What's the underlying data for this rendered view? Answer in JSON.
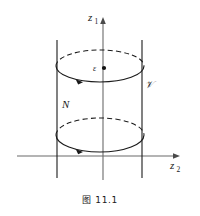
{
  "figure": {
    "caption": "图 11.1",
    "labels": {
      "vertical_axis": "z",
      "vertical_axis_subscript": "1",
      "horizontal_axis": "z",
      "horizontal_axis_subscript": "2",
      "center_point": "ε",
      "cylinder_left": "N",
      "cylinder_right": "𝒱"
    },
    "colors": {
      "stroke": "#1a1a1a",
      "axis": "#555555",
      "background": "#ffffff"
    },
    "geometry": {
      "vertical_axis_x": 103,
      "vertical_axis_top_y": 18,
      "vertical_axis_bottom_y": 180,
      "horizontal_axis_y": 156,
      "horizontal_axis_left_x": 17,
      "horizontal_axis_right_x": 180,
      "left_wall_x": 57,
      "right_wall_x": 142,
      "wall_top_y": 40,
      "wall_bottom_y": 178,
      "top_ellipse_cx": 100,
      "top_ellipse_cy": 66,
      "top_ellipse_rx": 44,
      "top_ellipse_ry": 16,
      "bottom_ellipse_cx": 100,
      "bottom_ellipse_cy": 135,
      "bottom_ellipse_rx": 44,
      "bottom_ellipse_ry": 17,
      "center_dot_x": 104,
      "center_dot_y": 68
    }
  }
}
